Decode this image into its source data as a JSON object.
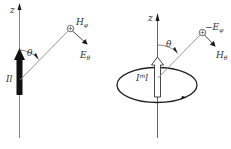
{
  "left_diagram": {
    "axis_label": "z",
    "theta_label": "θ",
    "source_label": "Il",
    "field_h_label": "H",
    "field_h_sub": "φ",
    "field_e_label": "E",
    "field_e_sub": "θ"
  },
  "right_diagram": {
    "axis_label": "z",
    "theta_label": "θ",
    "source_label": "I",
    "source_sup": "m",
    "source_tail": "l",
    "field_e_label": "−E",
    "field_e_sub": "φ",
    "field_h_label": "H",
    "field_h_sub": "θ"
  },
  "colors": {
    "line": "#8a8a8a",
    "dark": "#1a1a1a",
    "text": "#333333"
  }
}
